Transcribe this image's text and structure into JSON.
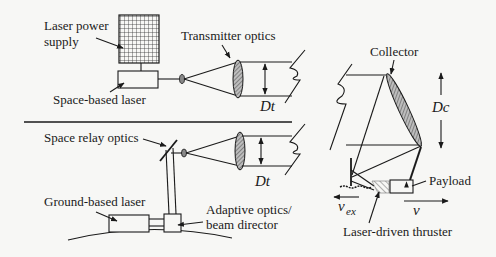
{
  "diagram": {
    "labels": {
      "laser_power_supply_line1": "Laser power",
      "laser_power_supply_line2": "supply",
      "space_based_laser": "Space-based laser",
      "transmitter_optics": "Transmitter optics",
      "dt_top": "Dt",
      "dt_bottom": "Dt",
      "space_relay_optics": "Space relay optics",
      "ground_based_laser": "Ground-based laser",
      "adaptive_optics_line1": "Adaptive optics/",
      "adaptive_optics_line2": "beam director",
      "collector": "Collector",
      "dc": "Dc",
      "payload": "Payload",
      "vex_main": "v",
      "vex_sub": "ex",
      "v": "v",
      "laser_driven_thruster": "Laser-driven thruster"
    },
    "colors": {
      "line": "#1a1a1a",
      "background": "#f7f7f5",
      "lens_fill": "#8a8a8a"
    }
  }
}
